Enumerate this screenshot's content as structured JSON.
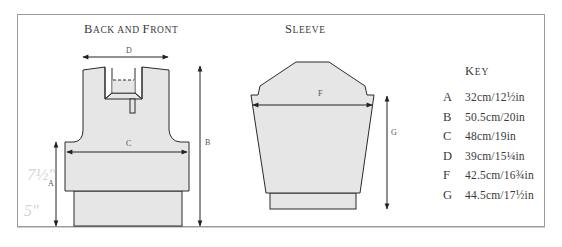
{
  "titles": {
    "back_front": {
      "initial_1": "B",
      "rest_1": "ACK AND ",
      "initial_2": "F",
      "rest_2": "RONT"
    },
    "sleeve": {
      "initial": "S",
      "rest": "LEEVE"
    }
  },
  "diagram_labels": {
    "A": "A",
    "B": "B",
    "C": "C",
    "D": "D",
    "F": "F",
    "G": "G"
  },
  "handwritten_notes": {
    "upper": "7½\"",
    "lower": "5\""
  },
  "key": {
    "title_initial": "K",
    "title_rest": "EY",
    "items": [
      {
        "letter": "A",
        "value": "32cm/12½in"
      },
      {
        "letter": "B",
        "value": "50.5cm/20in"
      },
      {
        "letter": "C",
        "value": "48cm/19in"
      },
      {
        "letter": "D",
        "value": "39cm/15¼in"
      },
      {
        "letter": "F",
        "value": "42.5cm/16¾in"
      },
      {
        "letter": "G",
        "value": "44.5cm/17½in"
      }
    ]
  },
  "colors": {
    "fill": "#e6e6e6",
    "stroke": "#2a2a2a",
    "border": "#9a9a9a"
  }
}
